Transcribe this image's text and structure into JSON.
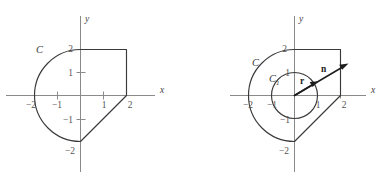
{
  "figures": [
    {
      "id": "left",
      "axes": {
        "x_axis_label": "x",
        "y_axis_label": "y",
        "x_ticks": [
          {
            "label": "−2",
            "value": -2
          },
          {
            "label": "−1",
            "value": -1
          },
          {
            "label": "1",
            "value": 1
          },
          {
            "label": "2",
            "value": 2
          }
        ],
        "y_ticks": [
          {
            "label": "2",
            "value": 2
          },
          {
            "label": "1",
            "value": 1
          },
          {
            "label": "−1",
            "value": -1
          },
          {
            "label": "−2",
            "value": -2
          }
        ]
      },
      "labels": [
        {
          "name": "outer-curve-label",
          "text": "C",
          "subscript": ""
        }
      ],
      "vectors": []
    },
    {
      "id": "right",
      "axes": {
        "x_axis_label": "x",
        "y_axis_label": "y",
        "x_ticks": [
          {
            "label": "−2",
            "value": -2
          },
          {
            "label": "−1",
            "value": -1
          },
          {
            "label": "1",
            "value": 1
          },
          {
            "label": "2",
            "value": 2
          }
        ],
        "y_ticks": [
          {
            "label": "2",
            "value": 2
          },
          {
            "label": "1",
            "value": 1
          },
          {
            "label": "−1",
            "value": -1
          },
          {
            "label": "−2",
            "value": -2
          }
        ]
      },
      "labels": [
        {
          "name": "outer-curve-label",
          "text": "C",
          "subscript": ""
        },
        {
          "name": "inner-curve-label",
          "text": "C",
          "subscript": "1"
        }
      ],
      "vectors": [
        {
          "name": "radius-vector",
          "text": "r"
        },
        {
          "name": "normal-vector",
          "text": "n"
        }
      ]
    }
  ],
  "geometry": {
    "outer_region_description": "Semicircular arc of radius 2 on the left half plane from (0,2) through (-2,0) to (0,-2); top edge from (0,2) to (2,2); right edge from (2,2) to (2,0); slanted edge from (2,0) to (0,-2)",
    "inner_circle_radius": 1,
    "outer_arc_radius": 2
  },
  "colors": {
    "contour": "#3a3a3a",
    "axis": "#8a8a8a",
    "vector": "#1d1d1d",
    "tick_text": "#555555",
    "background": "#ffffff"
  }
}
